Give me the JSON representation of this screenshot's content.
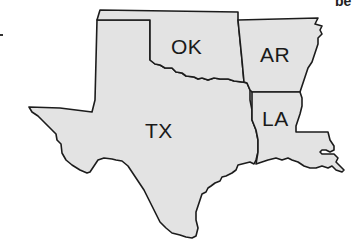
{
  "map": {
    "title": "",
    "fill_color": "#e3e3e3",
    "stroke_color": "#1c1c1c",
    "states": [
      {
        "abbr": "OK",
        "name": "Oklahoma"
      },
      {
        "abbr": "AR",
        "name": "Arkansas"
      },
      {
        "abbr": "TX",
        "name": "Texas"
      },
      {
        "abbr": "LA",
        "name": "Louisiana"
      }
    ]
  },
  "labels": {
    "ok": "OK",
    "ar": "AR",
    "tx": "TX",
    "la": "LA"
  },
  "cropped_text": {
    "top_right": "be"
  }
}
